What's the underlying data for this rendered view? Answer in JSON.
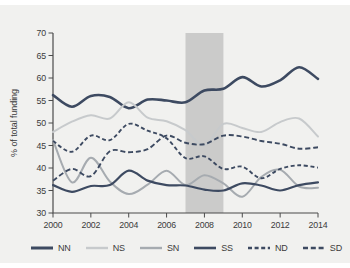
{
  "ylabel_text": "% of total funding",
  "chart_data": {
    "type": "line",
    "title": "",
    "xlabel": "",
    "ylabel": "% of total funding",
    "xlim": [
      2000,
      2014
    ],
    "ylim": [
      30,
      70
    ],
    "grid": false,
    "legend_position": "bottom",
    "axis_color": "#4b4b4b",
    "tick_label_color": "#3b3b3b",
    "background_color": "#f1f1ef",
    "highlight_band": {
      "x_start": 2007,
      "x_end": 2009,
      "color": "#cbcbca"
    },
    "x": [
      2000,
      2001,
      2002,
      2003,
      2004,
      2005,
      2006,
      2007,
      2008,
      2009,
      2010,
      2011,
      2012,
      2013,
      2014
    ],
    "xticks": [
      2000,
      2002,
      2004,
      2006,
      2008,
      2010,
      2012,
      2014
    ],
    "yticks": [
      30,
      35,
      40,
      45,
      50,
      55,
      60,
      65,
      70
    ],
    "series": [
      {
        "name": "NN",
        "color": "#3d4a61",
        "width": 2.6,
        "dash": null,
        "values": [
          56.2,
          53.6,
          56.0,
          55.8,
          53.3,
          55.2,
          55.0,
          54.6,
          57.2,
          57.6,
          60.2,
          58.1,
          59.5,
          62.4,
          59.8
        ]
      },
      {
        "name": "NS",
        "color": "#c7cacc",
        "width": 2.0,
        "dash": null,
        "values": [
          48.0,
          50.3,
          51.7,
          51.0,
          54.6,
          51.2,
          50.4,
          48.4,
          45.0,
          49.8,
          48.9,
          48.0,
          50.2,
          51.0,
          47.0
        ]
      },
      {
        "name": "SN",
        "color": "#a6abb0",
        "width": 2.0,
        "dash": null,
        "values": [
          46.2,
          36.8,
          42.3,
          37.0,
          34.2,
          36.3,
          39.4,
          36.2,
          38.4,
          36.6,
          33.6,
          38.0,
          39.6,
          35.9,
          35.6
        ]
      },
      {
        "name": "SS",
        "color": "#3d4a61",
        "width": 2.2,
        "dash": null,
        "values": [
          36.2,
          34.7,
          36.0,
          36.2,
          39.4,
          37.2,
          36.2,
          36.1,
          35.2,
          35.0,
          36.6,
          36.1,
          35.0,
          36.2,
          36.8
        ]
      },
      {
        "name": "ND",
        "color": "#3d4a61",
        "width": 1.9,
        "dash": "4 2.6",
        "values": [
          46.0,
          43.6,
          47.2,
          46.2,
          49.8,
          48.3,
          46.6,
          42.2,
          42.6,
          39.8,
          40.3,
          37.7,
          39.8,
          40.6,
          40.1
        ]
      },
      {
        "name": "SD",
        "color": "#3d4a61",
        "width": 1.9,
        "dash": "5 2.8",
        "values": [
          37.2,
          39.8,
          38.2,
          43.7,
          43.5,
          44.2,
          47.2,
          45.6,
          45.3,
          47.2,
          47.0,
          46.0,
          45.4,
          44.3,
          44.6
        ]
      }
    ]
  }
}
